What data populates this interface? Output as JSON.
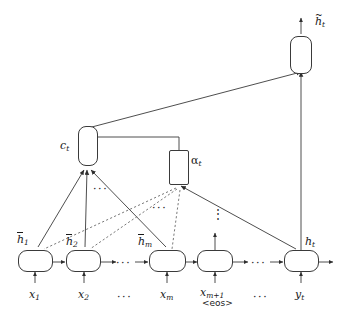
{
  "figure": {
    "name": "attention-mechanism-diagram",
    "background": "#ffffff",
    "stroke": "#3a3a3a",
    "dash_stroke": "#6b6b6b",
    "width": 348,
    "height": 316
  },
  "nodes": {
    "attentional_state": {
      "label_base": "h",
      "label_sub": "t",
      "accent": "~",
      "full": "h_t (tilde)"
    },
    "context_vector": {
      "label_base": "c",
      "label_sub": "t",
      "full": "c_t"
    },
    "attention_weights": {
      "label_base": "α",
      "label_sub": "t",
      "full": "alpha_t"
    },
    "decoder_state": {
      "label_base": "h",
      "label_sub": "t",
      "full": "h_t"
    }
  },
  "encoder": {
    "cells": [
      {
        "state_base": "h",
        "state_sub": "1",
        "state_accent": "bar",
        "input_base": "x",
        "input_sub": "1"
      },
      {
        "state_base": "h",
        "state_sub": "2",
        "state_accent": "bar",
        "input_base": "x",
        "input_sub": "2"
      },
      {
        "state_base": "h",
        "state_sub": "m",
        "state_accent": "bar",
        "input_base": "x",
        "input_sub": "m"
      },
      {
        "state_base": "",
        "state_sub": "",
        "state_accent": "",
        "input_base": "x",
        "input_sub": "m+1",
        "input_extra": "<eos>"
      }
    ]
  },
  "decoder": {
    "cells": [
      {
        "state_base": "h",
        "state_sub": "t",
        "input_base": "y",
        "input_sub": "t"
      }
    ]
  },
  "ellipses": {
    "horizontal_sequence_1": "···",
    "horizontal_sequence_2": "···",
    "input_gap_1": "···",
    "input_gap_2": "···",
    "context_fan": "···",
    "alpha_fan": "···",
    "vertical_stack": "⋮"
  }
}
